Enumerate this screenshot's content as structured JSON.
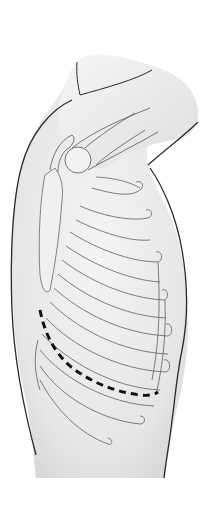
{
  "illustration": {
    "subject": "lateral torso with rib cage and scapula",
    "view": "left lateral, arm raised",
    "marker": "dashed line along lower lung border",
    "colors": {
      "background": "#ffffff",
      "skin_fill": "#ededed",
      "skin_shade": "#dcdcdc",
      "outline": "#2a2a2a",
      "rib_stroke": "#6e6e6e",
      "rib_fill": "#f4f4f4",
      "dashed_line": "#111111"
    }
  }
}
